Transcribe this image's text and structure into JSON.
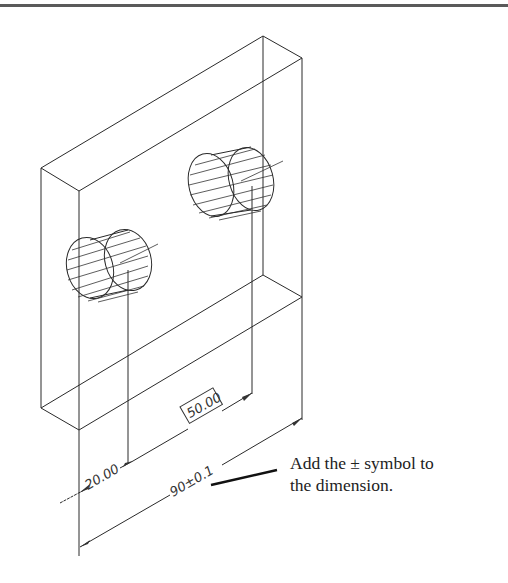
{
  "drawing": {
    "dimensions": {
      "hole_offset": "20.00",
      "hole_spacing_basic": "50.00",
      "overall_width": "90±0.1"
    }
  },
  "callout": {
    "line1": "Add the ± symbol to",
    "line2": "the dimension."
  }
}
